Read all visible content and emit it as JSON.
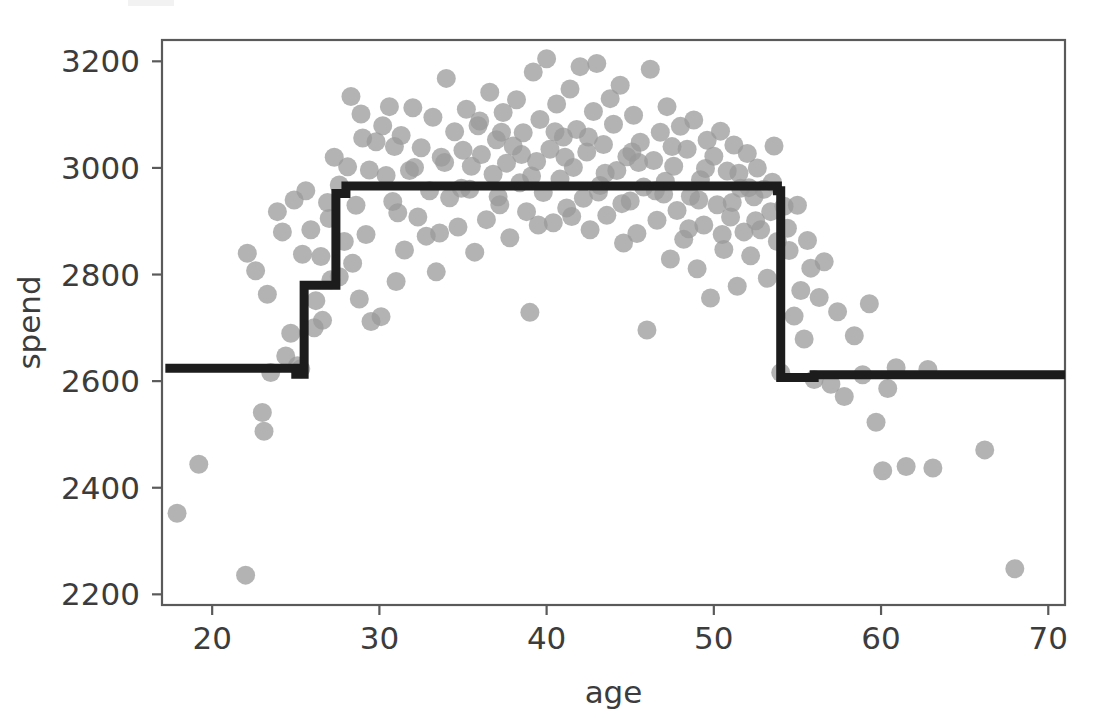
{
  "figure": {
    "width": 1104,
    "height": 718,
    "background": "#ffffff"
  },
  "axes": {
    "x_label": "age",
    "y_label": "spend",
    "x_ticks": [
      "20",
      "30",
      "40",
      "50",
      "60",
      "70"
    ],
    "y_ticks": [
      "2200",
      "2400",
      "2600",
      "2800",
      "3000",
      "3200"
    ],
    "tick_color": "#3c3c3c",
    "spine_color": "#5a5a5a"
  },
  "chart_data": {
    "type": "scatter",
    "title": "",
    "xlabel": "age",
    "ylabel": "spend",
    "xlim": [
      17.0,
      71.0
    ],
    "ylim": [
      2180,
      3240
    ],
    "x_ticks": [
      20,
      30,
      40,
      50,
      60,
      70
    ],
    "y_ticks": [
      2200,
      2400,
      2600,
      2800,
      3000,
      3200
    ],
    "grid": false,
    "legend": null,
    "series": [
      {
        "name": "observations",
        "type": "scatter",
        "color": "#999999",
        "marker": "circle",
        "marker_size": 19,
        "alpha": 0.75,
        "points": [
          [
            17.9,
            2352
          ],
          [
            19.2,
            2444
          ],
          [
            22.0,
            2236
          ],
          [
            22.1,
            2840
          ],
          [
            22.6,
            2807
          ],
          [
            23.0,
            2541
          ],
          [
            23.1,
            2506
          ],
          [
            23.3,
            2763
          ],
          [
            23.5,
            2616
          ],
          [
            23.9,
            2918
          ],
          [
            24.2,
            2880
          ],
          [
            24.4,
            2647
          ],
          [
            24.7,
            2690
          ],
          [
            25.1,
            2629
          ],
          [
            25.3,
            2623
          ],
          [
            25.6,
            2957
          ],
          [
            25.9,
            2884
          ],
          [
            26.2,
            2751
          ],
          [
            26.5,
            2834
          ],
          [
            26.6,
            2714
          ],
          [
            27.0,
            2905
          ],
          [
            27.3,
            3020
          ],
          [
            27.6,
            2796
          ],
          [
            27.9,
            2862
          ],
          [
            28.1,
            3002
          ],
          [
            28.3,
            3134
          ],
          [
            28.6,
            2930
          ],
          [
            28.8,
            2754
          ],
          [
            29.0,
            3056
          ],
          [
            29.2,
            2875
          ],
          [
            29.5,
            2712
          ],
          [
            29.8,
            3049
          ],
          [
            30.1,
            2721
          ],
          [
            30.4,
            2986
          ],
          [
            30.6,
            3115
          ],
          [
            30.8,
            2937
          ],
          [
            31.0,
            2787
          ],
          [
            31.3,
            3061
          ],
          [
            31.5,
            2846
          ],
          [
            31.8,
            2995
          ],
          [
            32.0,
            3113
          ],
          [
            32.3,
            2908
          ],
          [
            32.5,
            3038
          ],
          [
            32.8,
            2872
          ],
          [
            33.0,
            2957
          ],
          [
            33.2,
            3095
          ],
          [
            33.4,
            2805
          ],
          [
            33.7,
            3020
          ],
          [
            34.0,
            3168
          ],
          [
            34.2,
            2944
          ],
          [
            34.5,
            3068
          ],
          [
            34.7,
            2889
          ],
          [
            35.0,
            3033
          ],
          [
            35.2,
            3110
          ],
          [
            35.4,
            2960
          ],
          [
            35.7,
            2842
          ],
          [
            35.9,
            3079
          ],
          [
            36.1,
            3025
          ],
          [
            36.4,
            2903
          ],
          [
            36.6,
            3142
          ],
          [
            36.8,
            2988
          ],
          [
            37.0,
            3053
          ],
          [
            37.2,
            2931
          ],
          [
            37.4,
            3104
          ],
          [
            37.6,
            3009
          ],
          [
            37.8,
            2869
          ],
          [
            38.0,
            3041
          ],
          [
            38.2,
            3128
          ],
          [
            38.4,
            2972
          ],
          [
            38.6,
            3066
          ],
          [
            38.8,
            2918
          ],
          [
            39.0,
            2729
          ],
          [
            39.2,
            3180
          ],
          [
            39.4,
            3012
          ],
          [
            39.6,
            3091
          ],
          [
            39.8,
            2954
          ],
          [
            40.0,
            3205
          ],
          [
            40.2,
            3035
          ],
          [
            40.4,
            2897
          ],
          [
            40.6,
            3120
          ],
          [
            40.8,
            2979
          ],
          [
            41.0,
            3058
          ],
          [
            41.2,
            2925
          ],
          [
            41.4,
            3148
          ],
          [
            41.6,
            3001
          ],
          [
            41.8,
            3072
          ],
          [
            42.0,
            3190
          ],
          [
            42.2,
            2943
          ],
          [
            42.4,
            3030
          ],
          [
            42.6,
            2884
          ],
          [
            42.8,
            3106
          ],
          [
            43.0,
            3196
          ],
          [
            43.2,
            2967
          ],
          [
            43.4,
            3044
          ],
          [
            43.6,
            2911
          ],
          [
            43.8,
            3130
          ],
          [
            44.0,
            3082
          ],
          [
            44.2,
            2995
          ],
          [
            44.4,
            3155
          ],
          [
            44.6,
            2859
          ],
          [
            44.8,
            3021
          ],
          [
            45.0,
            2938
          ],
          [
            45.2,
            3099
          ],
          [
            45.4,
            2877
          ],
          [
            45.6,
            3048
          ],
          [
            45.8,
            2964
          ],
          [
            46.0,
            2696
          ],
          [
            46.2,
            3185
          ],
          [
            46.4,
            3014
          ],
          [
            46.6,
            2902
          ],
          [
            46.8,
            3067
          ],
          [
            47.0,
            2951
          ],
          [
            47.2,
            3115
          ],
          [
            47.4,
            2829
          ],
          [
            47.6,
            3003
          ],
          [
            47.8,
            2920
          ],
          [
            48.0,
            3078
          ],
          [
            48.2,
            2866
          ],
          [
            48.4,
            3035
          ],
          [
            48.6,
            2947
          ],
          [
            48.8,
            3090
          ],
          [
            49.0,
            2811
          ],
          [
            49.2,
            2978
          ],
          [
            49.4,
            2893
          ],
          [
            49.6,
            3052
          ],
          [
            49.8,
            2756
          ],
          [
            50.0,
            3022
          ],
          [
            50.2,
            2931
          ],
          [
            50.4,
            3069
          ],
          [
            50.6,
            2847
          ],
          [
            50.8,
            2994
          ],
          [
            51.0,
            2908
          ],
          [
            51.2,
            3043
          ],
          [
            51.4,
            2778
          ],
          [
            51.6,
            2962
          ],
          [
            51.8,
            2880
          ],
          [
            52.0,
            3027
          ],
          [
            52.2,
            2835
          ],
          [
            52.4,
            2946
          ],
          [
            52.6,
            3000
          ],
          [
            52.8,
            2884
          ],
          [
            53.0,
            2960
          ],
          [
            53.2,
            2793
          ],
          [
            53.4,
            2918
          ],
          [
            53.6,
            3041
          ],
          [
            53.8,
            2862
          ],
          [
            54.0,
            2616
          ],
          [
            54.2,
            2928
          ],
          [
            54.5,
            2845
          ],
          [
            54.8,
            2722
          ],
          [
            55.0,
            2930
          ],
          [
            55.2,
            2770
          ],
          [
            55.4,
            2679
          ],
          [
            55.6,
            2864
          ],
          [
            55.8,
            2812
          ],
          [
            56.0,
            2603
          ],
          [
            56.3,
            2757
          ],
          [
            56.6,
            2824
          ],
          [
            57.0,
            2594
          ],
          [
            57.4,
            2730
          ],
          [
            57.8,
            2571
          ],
          [
            58.4,
            2685
          ],
          [
            58.9,
            2612
          ],
          [
            59.3,
            2745
          ],
          [
            59.7,
            2523
          ],
          [
            60.1,
            2432
          ],
          [
            60.4,
            2586
          ],
          [
            60.9,
            2625
          ],
          [
            61.5,
            2440
          ],
          [
            62.8,
            2622
          ],
          [
            63.1,
            2437
          ],
          [
            66.2,
            2471
          ],
          [
            68.0,
            2248
          ],
          [
            26.9,
            2935
          ],
          [
            27.6,
            2968
          ],
          [
            28.4,
            2821
          ],
          [
            29.4,
            2996
          ],
          [
            30.2,
            3079
          ],
          [
            31.1,
            2916
          ],
          [
            32.1,
            3001
          ],
          [
            33.6,
            2878
          ],
          [
            34.9,
            2962
          ],
          [
            36.0,
            3088
          ],
          [
            37.1,
            2946
          ],
          [
            38.5,
            3025
          ],
          [
            39.5,
            2893
          ],
          [
            40.5,
            3068
          ],
          [
            41.5,
            2909
          ],
          [
            42.5,
            3058
          ],
          [
            43.5,
            2990
          ],
          [
            44.5,
            2933
          ],
          [
            45.5,
            3010
          ],
          [
            46.5,
            2957
          ],
          [
            47.5,
            3040
          ],
          [
            48.5,
            2886
          ],
          [
            49.5,
            2999
          ],
          [
            50.5,
            2875
          ],
          [
            51.5,
            2990
          ],
          [
            52.5,
            2901
          ],
          [
            53.5,
            2973
          ],
          [
            24.9,
            2940
          ],
          [
            25.4,
            2838
          ],
          [
            26.1,
            2700
          ],
          [
            27.1,
            2790
          ],
          [
            28.9,
            3101
          ],
          [
            30.9,
            3040
          ],
          [
            33.9,
            3010
          ],
          [
            35.5,
            3003
          ],
          [
            37.3,
            3067
          ],
          [
            39.1,
            2985
          ],
          [
            41.1,
            3020
          ],
          [
            43.1,
            2955
          ],
          [
            45.1,
            3030
          ],
          [
            47.1,
            2975
          ],
          [
            49.1,
            2940
          ],
          [
            51.1,
            2935
          ],
          [
            52.1,
            2963
          ],
          [
            54.4,
            2887
          ]
        ]
      },
      {
        "name": "regression-tree-fit",
        "type": "step-line",
        "color": "#1c1c1c",
        "line_width": 9,
        "vertices": [
          [
            17.2,
            2624
          ],
          [
            25.0,
            2624
          ],
          [
            25.0,
            2613
          ],
          [
            25.5,
            2613
          ],
          [
            25.5,
            2780
          ],
          [
            27.4,
            2780
          ],
          [
            27.4,
            2952
          ],
          [
            28.0,
            2952
          ],
          [
            28.0,
            2966
          ],
          [
            53.8,
            2966
          ],
          [
            53.8,
            2957
          ],
          [
            54.0,
            2957
          ],
          [
            54.0,
            2607
          ],
          [
            56.0,
            2607
          ],
          [
            56.0,
            2612
          ],
          [
            71.0,
            2612
          ]
        ]
      }
    ]
  }
}
